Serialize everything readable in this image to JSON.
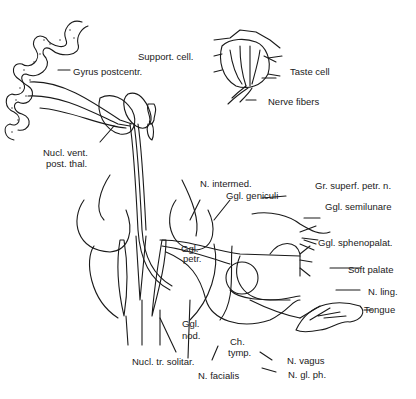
{
  "figure": {
    "inset": {
      "labels": {
        "support_cell": "Support. cell.",
        "taste_cell": "Taste cell",
        "nerve_fibers": "Nerve fibers"
      }
    },
    "labels": {
      "gyrus_postcentr": "Gyrus postcentr.",
      "nucl_vent_1": "Nucl. vent.",
      "nucl_vent_2": "post. thal.",
      "n_intermed": "N. intermed.",
      "ggl_geniculi": "Ggl. geniculi",
      "gr_superf_petr": "Gr. superf. petr. n.",
      "ggl_semilunare": "Ggl. semilunare",
      "ggl_sphenopalat": "Ggl. sphenopalat.",
      "soft_palate": "Soft palate",
      "n_ling": "N. ling.",
      "tongue": "Tongue",
      "ggl_petr_1": "Ggl.",
      "ggl_petr_2": "petr.",
      "ggl_nod_1": "Ggl.",
      "ggl_nod_2": "nod.",
      "ch_tymp_1": "Ch.",
      "ch_tymp_2": "tymp.",
      "n_vagus": "N. vagus",
      "n_gl_ph": "N. gl. ph.",
      "nucl_tr_solitar": "Nucl. tr. solitar.",
      "n_facialis": "N. facialis"
    },
    "colors": {
      "line": "#1a1a1a",
      "background": "#ffffff"
    }
  }
}
